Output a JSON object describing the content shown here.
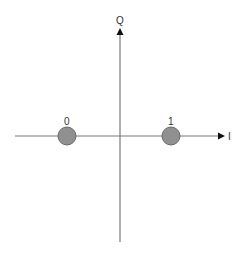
{
  "diagram": {
    "axes": {
      "horizontal_label": "I",
      "vertical_label": "Q",
      "color": "#7a7a7a"
    },
    "points": [
      {
        "label": "0",
        "i": -1,
        "q": 0
      },
      {
        "label": "1",
        "i": 1,
        "q": 0
      }
    ],
    "point_fill": "#909090",
    "point_stroke": "#6a6a6a"
  }
}
